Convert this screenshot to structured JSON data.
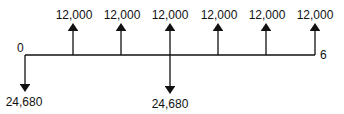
{
  "diagram": {
    "type": "cash-flow-diagram",
    "colors": {
      "line": "#111111",
      "text": "#111111",
      "background": "#ffffff"
    },
    "timeline": {
      "start_label": "0",
      "end_label": "6",
      "periods": 6
    },
    "flows": [
      {
        "period": 0,
        "direction": "down",
        "amount": "24,680"
      },
      {
        "period": 1,
        "direction": "up",
        "amount": "12,000"
      },
      {
        "period": 2,
        "direction": "up",
        "amount": "12,000"
      },
      {
        "period": 3,
        "direction": "up",
        "amount": "12,000"
      },
      {
        "period": 3,
        "direction": "down",
        "amount": "24,680"
      },
      {
        "period": 4,
        "direction": "up",
        "amount": "12,000"
      },
      {
        "period": 5,
        "direction": "up",
        "amount": "12,000"
      },
      {
        "period": 6,
        "direction": "up",
        "amount": "12,000"
      }
    ]
  }
}
